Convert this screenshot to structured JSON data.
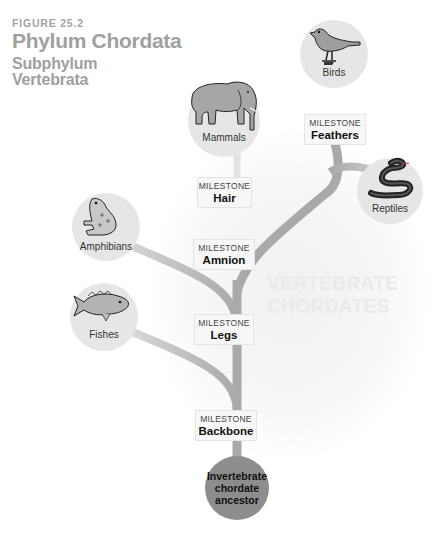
{
  "header": {
    "figure_label": "FIGURE 25.2",
    "title": "Phylum Chordata",
    "subtitle_line1": "Subphylum",
    "subtitle_line2": "Vertebrata"
  },
  "watermark": {
    "line1": "VERTEBRATE",
    "line2": "CHORDATES"
  },
  "root": {
    "label_line1": "Invertebrate",
    "label_line2": "chordate",
    "label_line3": "ancestor"
  },
  "milestones": [
    {
      "top": "MILESTONE",
      "name": "Backbone"
    },
    {
      "top": "MILESTONE",
      "name": "Legs"
    },
    {
      "top": "MILESTONE",
      "name": "Amnion"
    },
    {
      "top": "MILESTONE",
      "name": "Hair"
    },
    {
      "top": "MILESTONE",
      "name": "Feathers"
    }
  ],
  "groups": [
    {
      "label": "Fishes",
      "icon": "fish-icon"
    },
    {
      "label": "Amphibians",
      "icon": "frog-icon"
    },
    {
      "label": "Mammals",
      "icon": "elephant-icon"
    },
    {
      "label": "Reptiles",
      "icon": "snake-icon"
    },
    {
      "label": "Birds",
      "icon": "bird-icon"
    }
  ],
  "colors": {
    "branch": "#a9a9a9",
    "node_bg": "#e6e6e6",
    "ancestor": "#8d8d8d",
    "title": "#a0a0a0"
  }
}
